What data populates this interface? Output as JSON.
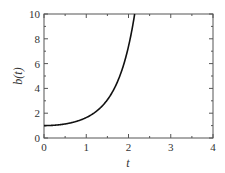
{
  "chart_data": {
    "type": "line",
    "title": "",
    "xlabel": "t",
    "ylabel": "b(t)",
    "xlim": [
      0,
      4
    ],
    "ylim": [
      0,
      10
    ],
    "xticks": [
      "0",
      "1",
      "2",
      "3",
      "4"
    ],
    "yticks": [
      "0",
      "2",
      "4",
      "6",
      "8",
      "10"
    ],
    "grid": false,
    "legend": null,
    "series": [
      {
        "name": "b(t)",
        "color": "#111111",
        "x": [
          0,
          0.25,
          0.5,
          0.75,
          1.0,
          1.25,
          1.5,
          1.75,
          2.0,
          2.1,
          2.15
        ],
        "values": [
          1.0,
          1.03,
          1.13,
          1.32,
          1.65,
          2.18,
          3.08,
          4.62,
          7.39,
          9.09,
          10.0
        ]
      }
    ]
  }
}
